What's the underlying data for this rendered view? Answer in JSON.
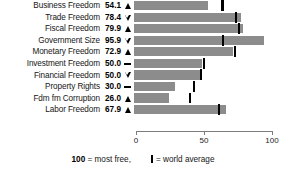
{
  "chart_data": {
    "type": "bar",
    "orientation": "horizontal",
    "title": "",
    "xlabel": "",
    "ylabel": "",
    "xlim": [
      0,
      100
    ],
    "xticks": [
      0,
      50,
      100
    ],
    "xtick_labels": [
      "0",
      "50",
      "100"
    ],
    "grid": false,
    "bar_color": "#8c8c8c",
    "marker_color": "#000000",
    "categories": [
      "Business Freedom",
      "Trade Freedom",
      "Fiscal Freedom",
      "Government Size",
      "Monetary Freedom",
      "Investment Freedom",
      "Financial Freedom",
      "Property Rights",
      "Fdm fm Corruption",
      "Labor Freedom"
    ],
    "values": [
      54.1,
      78.4,
      79.9,
      95.9,
      72.9,
      50.0,
      50.0,
      30.0,
      26.0,
      67.9
    ],
    "world_average": [
      64.3,
      74.5,
      76.3,
      64.6,
      73.4,
      50.7,
      48.5,
      43.6,
      40.5,
      61.5
    ],
    "trend": [
      "up",
      "down",
      "up",
      "down",
      "up",
      "flat",
      "down",
      "flat",
      "up",
      "up"
    ],
    "legend": {
      "most_free_value": "100",
      "most_free_text": "= most free,",
      "world_average_text": "= world average"
    }
  },
  "rows": [
    {
      "label": "Business Freedom",
      "value": "54.1",
      "trend": "up",
      "bar": 54.1,
      "avg": 64.3
    },
    {
      "label": "Trade Freedom",
      "value": "78.4",
      "trend": "down",
      "bar": 78.4,
      "avg": 74.5
    },
    {
      "label": "Fiscal Freedom",
      "value": "79.9",
      "trend": "up",
      "bar": 79.9,
      "avg": 76.3
    },
    {
      "label": "Government Size",
      "value": "95.9",
      "trend": "down",
      "bar": 95.9,
      "avg": 64.6
    },
    {
      "label": "Monetary Freedom",
      "value": "72.9",
      "trend": "up",
      "bar": 72.9,
      "avg": 73.4
    },
    {
      "label": "Investment Freedom",
      "value": "50.0",
      "trend": "flat",
      "bar": 50.0,
      "avg": 50.7
    },
    {
      "label": "Financial Freedom",
      "value": "50.0",
      "trend": "down",
      "bar": 50.0,
      "avg": 48.5
    },
    {
      "label": "Property Rights",
      "value": "30.0",
      "trend": "flat",
      "bar": 30.0,
      "avg": 43.6
    },
    {
      "label": "Fdm fm Corruption",
      "value": "26.0",
      "trend": "up",
      "bar": 26.0,
      "avg": 40.5
    },
    {
      "label": "Labor Freedom",
      "value": "67.9",
      "trend": "up",
      "bar": 67.9,
      "avg": 61.5
    }
  ],
  "axis": {
    "ticks": [
      {
        "label": "0",
        "value": 0
      },
      {
        "label": "50",
        "value": 50
      },
      {
        "label": "100",
        "value": 100
      }
    ]
  },
  "legend": {
    "most_free_value": "100",
    "most_free_text": "= most free,",
    "world_average_text": "= world average"
  }
}
